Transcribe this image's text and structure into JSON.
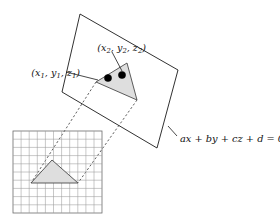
{
  "figure": {
    "colors": {
      "background": "#ffffff",
      "outline": "#1a1a1a",
      "triangle_fill": "#dedede",
      "triangle_stroke": "#4a4a4a",
      "grid_line": "#9a9a9a",
      "grid_border": "#6b6b6b",
      "dashed_line": "#2a2a2a",
      "dot": "#000000"
    },
    "labels": {
      "vertex1": {
        "open": "(",
        "x": "x",
        "x_sub": "1",
        "sep1": ", ",
        "y": "y",
        "y_sub": "1",
        "sep2": ", ",
        "z": "z",
        "z_sub": "1",
        "close": ")"
      },
      "vertex2": {
        "open": "(",
        "x": "x",
        "x_sub": "2",
        "sep1": ", ",
        "y": "y",
        "y_sub": "2",
        "sep2": ", ",
        "z": "z",
        "z_sub": "2",
        "close": ")"
      },
      "plane_equation": "ax + by + cz + d = 0"
    },
    "plane": {
      "name": "plane-quadrilateral",
      "points": "80,14 178,70 157,148 62,92"
    },
    "triangle_3d": {
      "name": "triangle-on-plane",
      "points": "96,82 127,63 137,100"
    },
    "triangle_2d": {
      "name": "triangle-on-grid",
      "points": "52,160 31,183 78,183"
    },
    "grid": {
      "name": "pixel-grid",
      "x": 13,
      "y": 131,
      "width": 89,
      "height": 82,
      "cols": 11,
      "rows": 10
    },
    "dots": [
      {
        "name": "vertex-dot-1",
        "cx": 108,
        "cy": 78,
        "r": 3.6
      },
      {
        "name": "vertex-dot-2",
        "cx": 122,
        "cy": 75,
        "r": 3.6
      }
    ],
    "projection_lines": [
      {
        "name": "projection-line-left",
        "d": "M 96,82 L 31,183"
      },
      {
        "name": "projection-line-right",
        "d": "M 137,100 L 78,183"
      }
    ],
    "leaders": [
      {
        "name": "leader-vertex1",
        "d": "M 66,72 L 98,80"
      },
      {
        "name": "leader-vertex2",
        "d": "M 112,52 L 122,71"
      },
      {
        "name": "leader-equation",
        "d": "M 168,126 L 177,136"
      }
    ]
  }
}
